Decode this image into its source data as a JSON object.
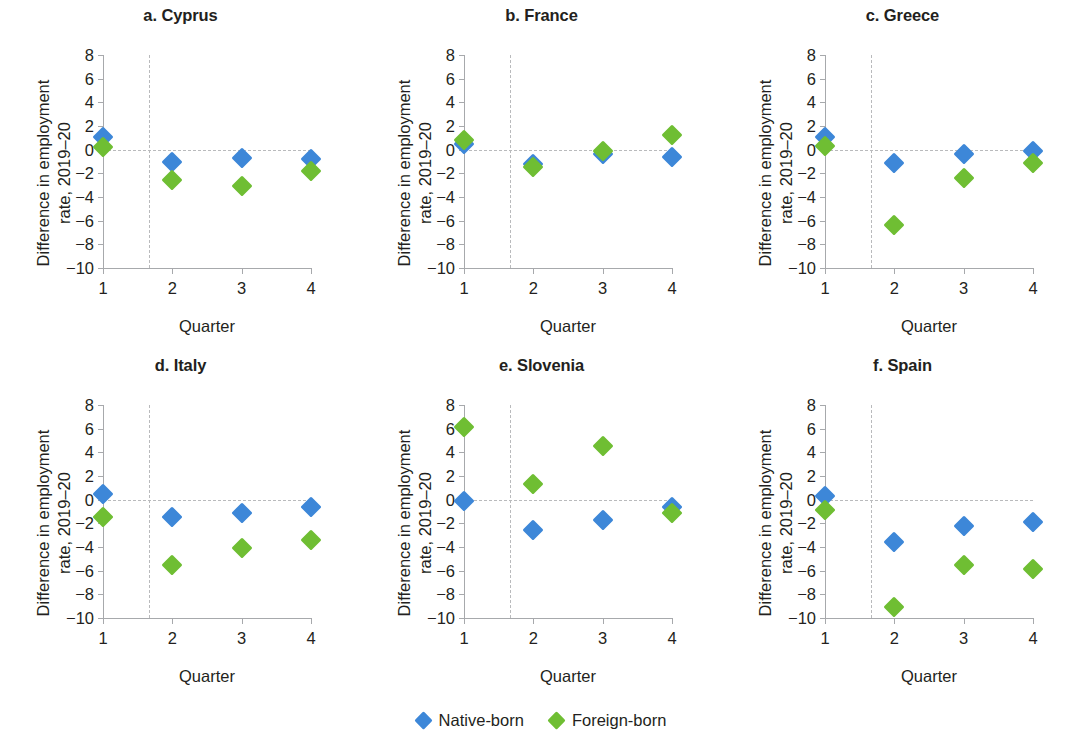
{
  "figure": {
    "xlabel": "Quarter",
    "ylabel_line1": "Difference in employment",
    "ylabel_line2": "rate, 2019–20"
  },
  "legend": {
    "position": "bottom-center",
    "entries": [
      {
        "label": "Native-born",
        "color": "#3d87d8",
        "marker": "diamond"
      },
      {
        "label": "Foreign-born",
        "color": "#6fbe33",
        "marker": "diamond"
      }
    ]
  },
  "axis": {
    "y_ticks": [
      "8",
      "6",
      "4",
      "2",
      "0",
      "−2",
      "−4",
      "−6",
      "−8",
      "−10"
    ],
    "y_tick_values": [
      8,
      6,
      4,
      2,
      0,
      -2,
      -4,
      -6,
      -8,
      -10
    ],
    "x_ticks": [
      "1",
      "2",
      "3",
      "4"
    ],
    "x_tick_values": [
      1,
      2,
      3,
      4
    ],
    "ylim": [
      -10,
      8
    ],
    "xlim": [
      1,
      4
    ],
    "zero_reference_line": 0,
    "vertical_reference_line_x": 1.67
  },
  "chart_data": [
    {
      "type": "scatter",
      "title": "a. Cyprus",
      "xlabel": "Quarter",
      "ylabel": "Difference in employment rate, 2019–20",
      "categories": [
        1,
        2,
        3,
        4
      ],
      "ylim": [
        -10,
        8
      ],
      "xlim": [
        1,
        4
      ],
      "grid": false,
      "legend": "bottom-center",
      "series": [
        {
          "name": "Native-born",
          "color": "#3d87d8",
          "values": [
            1.1,
            -1.0,
            -0.7,
            -0.8
          ]
        },
        {
          "name": "Foreign-born",
          "color": "#6fbe33",
          "values": [
            0.2,
            -2.6,
            -3.1,
            -1.8
          ]
        }
      ]
    },
    {
      "type": "scatter",
      "title": "b. France",
      "xlabel": "Quarter",
      "ylabel": "Difference in employment rate, 2019–20",
      "categories": [
        1,
        2,
        3,
        4
      ],
      "ylim": [
        -10,
        8
      ],
      "xlim": [
        1,
        4
      ],
      "grid": false,
      "legend": "bottom-center",
      "series": [
        {
          "name": "Native-born",
          "color": "#3d87d8",
          "values": [
            0.5,
            -1.2,
            -0.4,
            -0.6
          ]
        },
        {
          "name": "Foreign-born",
          "color": "#6fbe33",
          "values": [
            0.8,
            -1.5,
            -0.1,
            1.2
          ]
        }
      ]
    },
    {
      "type": "scatter",
      "title": "c. Greece",
      "xlabel": "Quarter",
      "ylabel": "Difference in employment rate, 2019–20",
      "categories": [
        1,
        2,
        3,
        4
      ],
      "ylim": [
        -10,
        8
      ],
      "xlim": [
        1,
        4
      ],
      "grid": false,
      "legend": "bottom-center",
      "series": [
        {
          "name": "Native-born",
          "color": "#3d87d8",
          "values": [
            1.1,
            -1.1,
            -0.4,
            -0.1
          ]
        },
        {
          "name": "Foreign-born",
          "color": "#6fbe33",
          "values": [
            0.3,
            -6.4,
            -2.4,
            -1.1
          ]
        }
      ]
    },
    {
      "type": "scatter",
      "title": "d. Italy",
      "xlabel": "Quarter",
      "ylabel": "Difference in employment rate, 2019–20",
      "categories": [
        1,
        2,
        3,
        4
      ],
      "ylim": [
        -10,
        8
      ],
      "xlim": [
        1,
        4
      ],
      "grid": false,
      "legend": "bottom-center",
      "series": [
        {
          "name": "Native-born",
          "color": "#3d87d8",
          "values": [
            0.5,
            -1.5,
            -1.1,
            -0.6
          ]
        },
        {
          "name": "Foreign-born",
          "color": "#6fbe33",
          "values": [
            -1.5,
            -5.5,
            -4.1,
            -3.4
          ]
        }
      ]
    },
    {
      "type": "scatter",
      "title": "e. Slovenia",
      "xlabel": "Quarter",
      "ylabel": "Difference in employment rate, 2019–20",
      "categories": [
        1,
        2,
        3,
        4
      ],
      "ylim": [
        -10,
        8
      ],
      "xlim": [
        1,
        4
      ],
      "grid": false,
      "legend": "bottom-center",
      "series": [
        {
          "name": "Native-born",
          "color": "#3d87d8",
          "values": [
            -0.1,
            -2.6,
            -1.7,
            -0.6
          ]
        },
        {
          "name": "Foreign-born",
          "color": "#6fbe33",
          "values": [
            6.1,
            1.3,
            4.5,
            -1.1
          ]
        }
      ]
    },
    {
      "type": "scatter",
      "title": "f. Spain",
      "xlabel": "Quarter",
      "ylabel": "Difference in employment rate, 2019–20",
      "categories": [
        1,
        2,
        3,
        4
      ],
      "ylim": [
        -10,
        8
      ],
      "xlim": [
        1,
        4
      ],
      "grid": false,
      "legend": "bottom-center",
      "series": [
        {
          "name": "Native-born",
          "color": "#3d87d8",
          "values": [
            0.3,
            -3.6,
            -2.2,
            -1.9
          ]
        },
        {
          "name": "Foreign-born",
          "color": "#6fbe33",
          "values": [
            -0.9,
            -9.1,
            -5.5,
            -5.9
          ]
        }
      ]
    }
  ]
}
